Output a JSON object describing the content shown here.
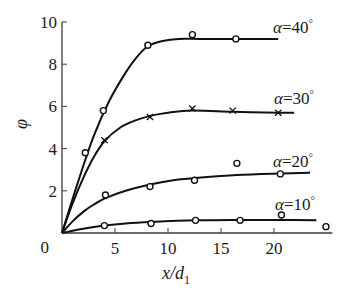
{
  "chart_data": {
    "type": "line",
    "title": "",
    "xlabel": "x/d",
    "xlabel_subscript": "1",
    "ylabel": "φ",
    "xlim": [
      0,
      25.5
    ],
    "ylim": [
      0,
      10
    ],
    "x_ticks": [
      0,
      5,
      10,
      15,
      20
    ],
    "x_tick_labels": [
      "0",
      "5",
      "10",
      "15",
      "20"
    ],
    "y_ticks": [
      0,
      2,
      4,
      6,
      8,
      10
    ],
    "y_tick_labels": [
      "0",
      "2",
      "4",
      "6",
      "8",
      "10"
    ],
    "grid": false,
    "legend": "inline-right",
    "series": [
      {
        "name": "α=40°",
        "label_alpha": "α",
        "label_eq": "=40",
        "label_deg": "°",
        "marker": "circle",
        "points": [
          [
            2.2,
            3.8
          ],
          [
            3.9,
            5.8
          ],
          [
            8.1,
            8.9
          ],
          [
            12.3,
            9.4
          ],
          [
            16.4,
            9.2
          ]
        ],
        "fit": [
          [
            0,
            0
          ],
          [
            1.5,
            2.4
          ],
          [
            3,
            4.6
          ],
          [
            4.5,
            6.3
          ],
          [
            6,
            7.6
          ],
          [
            7,
            8.3
          ],
          [
            8.1,
            8.85
          ],
          [
            9.5,
            9.1
          ],
          [
            11,
            9.2
          ],
          [
            13,
            9.2
          ],
          [
            16.4,
            9.2
          ],
          [
            20.4,
            9.2
          ]
        ]
      },
      {
        "name": "α=30°",
        "label_alpha": "α",
        "label_eq": "=30",
        "label_deg": "°",
        "marker": "cross",
        "points": [
          [
            4.0,
            4.4
          ],
          [
            8.3,
            5.5
          ],
          [
            12.3,
            5.9
          ],
          [
            16.1,
            5.8
          ],
          [
            20.4,
            5.7
          ]
        ],
        "fit": [
          [
            0,
            0
          ],
          [
            1,
            1.4
          ],
          [
            2,
            2.6
          ],
          [
            3,
            3.6
          ],
          [
            4,
            4.35
          ],
          [
            5.5,
            5.0
          ],
          [
            7,
            5.35
          ],
          [
            8.3,
            5.55
          ],
          [
            10,
            5.7
          ],
          [
            12.3,
            5.8
          ],
          [
            16.1,
            5.75
          ],
          [
            20.4,
            5.7
          ],
          [
            21.9,
            5.7
          ]
        ]
      },
      {
        "name": "α=20°",
        "label_alpha": "α",
        "label_eq": "=20",
        "label_deg": "°",
        "marker": "circle",
        "points": [
          [
            4.1,
            1.8
          ],
          [
            8.3,
            2.2
          ],
          [
            12.5,
            2.5
          ],
          [
            16.5,
            3.3
          ],
          [
            20.6,
            2.8
          ]
        ],
        "fit": [
          [
            0,
            0
          ],
          [
            1,
            0.55
          ],
          [
            2,
            1.0
          ],
          [
            3,
            1.35
          ],
          [
            4.1,
            1.65
          ],
          [
            6,
            2.0
          ],
          [
            8.3,
            2.3
          ],
          [
            10.5,
            2.5
          ],
          [
            12.5,
            2.6
          ],
          [
            16.5,
            2.75
          ],
          [
            20.6,
            2.82
          ],
          [
            23.4,
            2.85
          ]
        ]
      },
      {
        "name": "α=10°",
        "label_alpha": "α",
        "label_eq": "=10",
        "label_deg": "°",
        "marker": "circle",
        "points": [
          [
            4.0,
            0.35
          ],
          [
            8.4,
            0.45
          ],
          [
            12.6,
            0.6
          ],
          [
            16.8,
            0.6
          ],
          [
            20.7,
            0.85
          ],
          [
            24.9,
            0.3
          ]
        ],
        "fit": [
          [
            0,
            0
          ],
          [
            2,
            0.2
          ],
          [
            4,
            0.35
          ],
          [
            6,
            0.45
          ],
          [
            8.4,
            0.52
          ],
          [
            12.6,
            0.6
          ],
          [
            16.8,
            0.62
          ],
          [
            20.7,
            0.62
          ],
          [
            24.0,
            0.6
          ]
        ]
      }
    ]
  }
}
